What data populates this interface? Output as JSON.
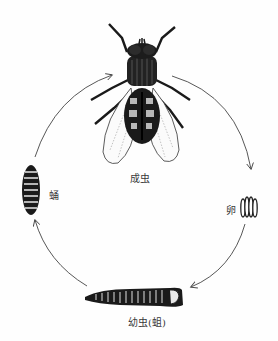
{
  "diagram": {
    "stages": [
      {
        "id": "adult",
        "label": "成虫"
      },
      {
        "id": "egg",
        "label": "卵"
      },
      {
        "id": "larva",
        "label": "幼虫(蛆)"
      },
      {
        "id": "pupa",
        "label": "蛹"
      }
    ],
    "cycle_order": [
      "adult",
      "egg",
      "larva",
      "pupa",
      "adult"
    ],
    "colors": {
      "ink": "#1a1a1a",
      "arrow": "#444444",
      "label": "#3a3a3a"
    }
  }
}
